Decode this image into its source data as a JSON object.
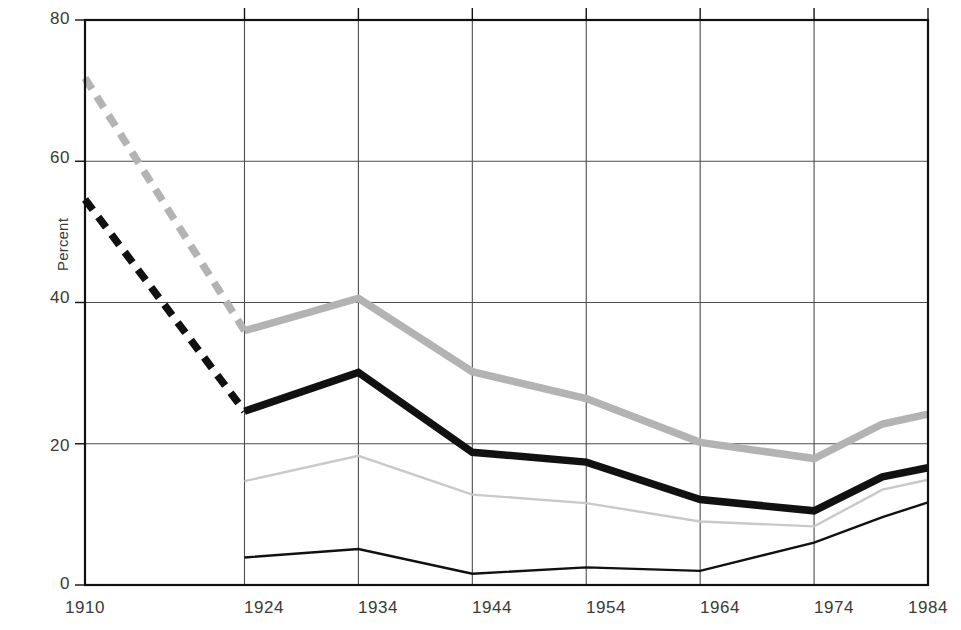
{
  "chart_data": {
    "type": "line",
    "title": "",
    "xlabel": "",
    "ylabel": "Percent",
    "xlim": [
      1910,
      1984
    ],
    "ylim": [
      0,
      80
    ],
    "yticks": [
      0,
      20,
      40,
      60,
      80
    ],
    "xticks": [
      1910,
      1924,
      1934,
      1944,
      1954,
      1964,
      1974,
      1984
    ],
    "grid": true,
    "legend": "none",
    "series": [
      {
        "name": "thick-gray-solid",
        "style": "solid",
        "width": "thick",
        "color": "#b3b3b3",
        "x": [
          1924,
          1934,
          1944,
          1954,
          1964,
          1974,
          1980,
          1984
        ],
        "values": [
          36.0,
          40.6,
          30.2,
          26.4,
          20.2,
          17.9,
          22.8,
          24.2
        ]
      },
      {
        "name": "thick-gray-dashed",
        "style": "dashed",
        "width": "thick",
        "color": "#b3b3b3",
        "x": [
          1910,
          1924
        ],
        "values": [
          71.8,
          36.0
        ]
      },
      {
        "name": "thick-black-solid",
        "style": "solid",
        "width": "thick",
        "color": "#111111",
        "x": [
          1924,
          1934,
          1944,
          1954,
          1964,
          1974,
          1980,
          1984
        ],
        "values": [
          24.6,
          30.1,
          18.8,
          17.4,
          12.1,
          10.5,
          15.3,
          16.6
        ]
      },
      {
        "name": "thick-black-dashed",
        "style": "dashed",
        "width": "thick",
        "color": "#111111",
        "x": [
          1910,
          1924
        ],
        "values": [
          54.6,
          24.6
        ]
      },
      {
        "name": "thin-gray-solid",
        "style": "solid",
        "width": "thin",
        "color": "#c9c9c9",
        "x": [
          1924,
          1934,
          1944,
          1954,
          1964,
          1974,
          1980,
          1984
        ],
        "values": [
          14.7,
          18.3,
          12.8,
          11.6,
          9.0,
          8.3,
          13.5,
          14.9
        ]
      },
      {
        "name": "thin-black-solid",
        "style": "solid",
        "width": "thin",
        "color": "#111111",
        "x": [
          1924,
          1934,
          1944,
          1954,
          1964,
          1974,
          1980,
          1984
        ],
        "values": [
          3.9,
          5.1,
          1.6,
          2.5,
          2.0,
          6.0,
          9.6,
          11.7
        ]
      }
    ]
  },
  "axes": {
    "ylabel": "Percent",
    "yticks": [
      {
        "label": "80"
      },
      {
        "label": "60"
      },
      {
        "label": "40"
      },
      {
        "label": "20"
      },
      {
        "label": "0"
      }
    ],
    "xticks": [
      {
        "label": "1910"
      },
      {
        "label": "1924"
      },
      {
        "label": "1934"
      },
      {
        "label": "1944"
      },
      {
        "label": "1954"
      },
      {
        "label": "1964"
      },
      {
        "label": "1974"
      },
      {
        "label": "1984"
      }
    ]
  },
  "colors": {
    "axis": "#111111",
    "grid": "#4d4d4d",
    "dark_series": "#111111",
    "mid_gray_series": "#b3b3b3",
    "light_gray_series": "#c9c9c9",
    "background": "#ffffff"
  }
}
